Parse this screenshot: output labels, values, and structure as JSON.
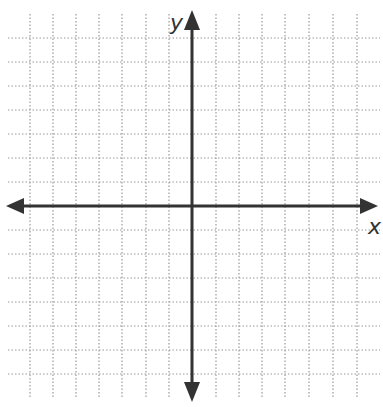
{
  "diagram": {
    "type": "coordinate-plane",
    "axes": {
      "x_label": "x",
      "y_label": "y",
      "arrows": "both-ends",
      "color": "#333333"
    },
    "grid": {
      "style": "dotted",
      "color": "#9a9a9a",
      "vertical_lines_x": [
        30,
        53,
        76,
        99,
        122,
        146,
        169,
        216,
        239,
        262,
        285,
        309,
        333,
        357
      ],
      "horizontal_lines_y": [
        38,
        62,
        86,
        110,
        134,
        158,
        182,
        230,
        254,
        278,
        302,
        326,
        350,
        374
      ],
      "units_left_of_y_axis": 7,
      "units_right_of_y_axis": 7,
      "units_above_x_axis": 7,
      "units_below_x_axis": 7
    },
    "origin": {
      "x": 192,
      "y": 206
    }
  }
}
